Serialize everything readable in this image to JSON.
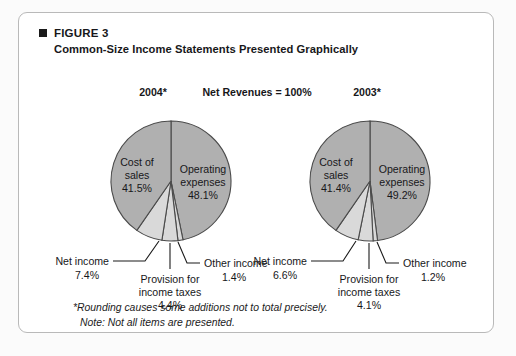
{
  "figure": {
    "bullet_icon": "square-bullet-icon",
    "label": "FIGURE 3",
    "subtitle": "Common-Size Income Statements Presented Graphically"
  },
  "column_headers": {
    "left": "2004*",
    "center": "Net Revenues = 100%",
    "right": "2003*"
  },
  "footnotes": {
    "line1": "*Rounding causes some additions not to total precisely.",
    "line2": "Note: Not all items are presented."
  },
  "colors": {
    "slice_major": "#b0b0b0",
    "slice_minor": "#d9d9d9",
    "slice_stroke": "#4a4a4a",
    "text": "#17171a",
    "frame_border": "#b9b9b9",
    "page_background": "#fbfbfb",
    "panel_background": "#ffffff"
  },
  "chart_data": [
    {
      "type": "pie",
      "title": "2004*",
      "subtitle": "Net Revenues = 100%",
      "unit": "percent",
      "total": 100,
      "legend": "none",
      "categories": [
        "Operating expenses",
        "Other income",
        "Provision for income taxes",
        "Net income",
        "Cost of sales"
      ],
      "values": [
        48.1,
        1.4,
        4.4,
        7.4,
        41.5
      ],
      "slices": [
        {
          "name": "Operating expenses",
          "value": 48.1,
          "label": "Operating expenses",
          "value_label": "48.1%",
          "fill": "#b0b0b0",
          "label_placement": "inside"
        },
        {
          "name": "Other income",
          "value": 1.4,
          "label": "Other income",
          "value_label": "1.4%",
          "fill": "#d9d9d9",
          "label_placement": "leader-right"
        },
        {
          "name": "Provision for income taxes",
          "value": 4.4,
          "label_line1": "Provision for",
          "label_line2": "income taxes",
          "value_label": "4.4%",
          "fill": "#d9d9d9",
          "label_placement": "leader-bottom"
        },
        {
          "name": "Net income",
          "value": 7.4,
          "label": "Net income",
          "value_label": "7.4%",
          "fill": "#d9d9d9",
          "label_placement": "leader-left"
        },
        {
          "name": "Cost of sales",
          "value": 41.5,
          "label_line1": "Cost of",
          "label_line2": "sales",
          "value_label": "41.5%",
          "fill": "#b0b0b0",
          "label_placement": "inside"
        }
      ]
    },
    {
      "type": "pie",
      "title": "2003*",
      "subtitle": "Net Revenues = 100%",
      "unit": "percent",
      "total": 100,
      "legend": "none",
      "categories": [
        "Operating expenses",
        "Other income",
        "Provision for income taxes",
        "Net income",
        "Cost of sales"
      ],
      "values": [
        49.2,
        1.2,
        4.1,
        6.6,
        41.4
      ],
      "slices": [
        {
          "name": "Operating expenses",
          "value": 49.2,
          "label": "Operating expenses",
          "value_label": "49.2%",
          "fill": "#b0b0b0",
          "label_placement": "inside"
        },
        {
          "name": "Other income",
          "value": 1.2,
          "label": "Other income",
          "value_label": "1.2%",
          "fill": "#d9d9d9",
          "label_placement": "leader-right"
        },
        {
          "name": "Provision for income taxes",
          "value": 4.1,
          "label_line1": "Provision for",
          "label_line2": "income taxes",
          "value_label": "4.1%",
          "fill": "#d9d9d9",
          "label_placement": "leader-bottom"
        },
        {
          "name": "Net income",
          "value": 6.6,
          "label": "Net income",
          "value_label": "6.6%",
          "fill": "#d9d9d9",
          "label_placement": "leader-left"
        },
        {
          "name": "Cost of sales",
          "value": 41.4,
          "label_line1": "Cost of",
          "label_line2": "sales",
          "value_label": "41.4%",
          "fill": "#b0b0b0",
          "label_placement": "inside"
        }
      ]
    }
  ]
}
